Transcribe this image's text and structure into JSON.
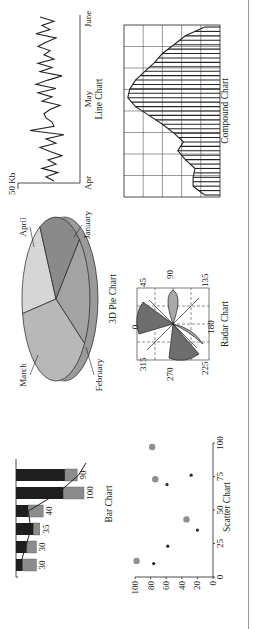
{
  "page": {
    "orientation": "rotated-90-ccw"
  },
  "chart_data": [
    {
      "id": "line",
      "type": "line",
      "title": "Line Chart",
      "ylabel": "50 Kb",
      "x_ticks": [
        "Apr",
        "May",
        "June"
      ],
      "values": [
        22,
        30,
        18,
        34,
        20,
        28,
        14,
        26,
        36,
        20,
        30,
        12,
        46,
        22,
        24,
        30,
        32,
        26,
        16,
        34,
        24,
        38,
        20,
        40,
        28,
        14,
        36,
        24,
        38,
        22,
        32,
        26,
        38,
        30,
        20,
        40,
        26,
        34,
        22,
        36
      ]
    },
    {
      "id": "compound",
      "type": "area",
      "title": "Compound Chart",
      "grid": true,
      "grid_cols": 8,
      "grid_rows": 5,
      "values": [
        8,
        14,
        14,
        13,
        18,
        22,
        19,
        24,
        30,
        37,
        44,
        48,
        47,
        44,
        39,
        34,
        30,
        24,
        18,
        8
      ],
      "ylim": [
        0,
        50
      ]
    },
    {
      "id": "pie",
      "type": "pie",
      "title": "3D Pie Chart",
      "labels": [
        "January",
        "February",
        "March",
        "April"
      ],
      "values": [
        20,
        22,
        38,
        20
      ],
      "colors": [
        "#8a8a8a",
        "#a3a3a3",
        "#b8b8b8",
        "#d6d6d6"
      ]
    },
    {
      "id": "radar",
      "type": "radar",
      "title": "Radar Chart",
      "angle_labels": [
        "0",
        "45",
        "90",
        "135",
        "180",
        "225",
        "270",
        "315"
      ]
    },
    {
      "id": "bar",
      "type": "bar",
      "title": "Bar Chart",
      "categories": [
        "1",
        "2",
        "3",
        "4",
        "5",
        "6"
      ],
      "values": [
        30,
        30,
        35,
        40,
        100,
        90
      ],
      "series": [
        {
          "name": "base",
          "values": [
            10,
            16,
            26,
            18,
            70,
            72
          ],
          "color": "#1e1e1e"
        },
        {
          "name": "top",
          "values": [
            20,
            14,
            9,
            22,
            30,
            18
          ],
          "color": "#8c8c8c"
        }
      ],
      "line_overlay": [
        6,
        14,
        22,
        18,
        62,
        92
      ]
    },
    {
      "id": "scatter",
      "type": "scatter",
      "title": "Scatter Chart",
      "x_ticks": [
        "0",
        "25",
        "50",
        "75",
        "100"
      ],
      "y_ticks": [
        "0",
        "20",
        "40",
        "60",
        "80",
        "100"
      ],
      "xlim": [
        0,
        100
      ],
      "ylim": [
        0,
        100
      ],
      "series": [
        {
          "name": "large",
          "color": "#8f8f8f",
          "points": [
            [
              12,
              98
            ],
            [
              43,
              34
            ],
            [
              73,
              74
            ],
            [
              97,
              78
            ]
          ]
        },
        {
          "name": "small",
          "color": "#2a2a2a",
          "points": [
            [
              10,
              76
            ],
            [
              23,
              58
            ],
            [
              35,
              20
            ],
            [
              69,
              59
            ],
            [
              76,
              28
            ]
          ]
        }
      ]
    }
  ]
}
